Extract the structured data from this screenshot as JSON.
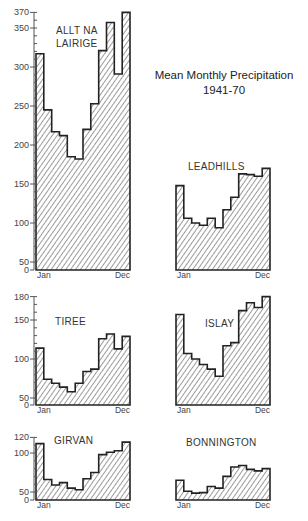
{
  "chart_data": {
    "type": "bar",
    "title": "Mean Monthly Precipitation",
    "subtitle": "1941-70",
    "xlabel_start": "Jan",
    "xlabel_end": "Dec",
    "categories": [
      "Jan",
      "Feb",
      "Mar",
      "Apr",
      "May",
      "Jun",
      "Jul",
      "Aug",
      "Sep",
      "Oct",
      "Nov",
      "Dec"
    ],
    "panels": [
      {
        "name": "ALLT NA LAIRIGE",
        "row": 0,
        "col": 0,
        "ylim": [
          0,
          370
        ],
        "yticks": [
          0,
          50,
          100,
          150,
          200,
          250,
          300,
          350,
          370
        ],
        "values": [
          317,
          245,
          217,
          212,
          185,
          182,
          220,
          253,
          321,
          357,
          291,
          370
        ]
      },
      {
        "name": "LEADHILLS",
        "row": 0,
        "col": 1,
        "ylim": [
          0,
          370
        ],
        "yticks": [],
        "values": [
          148,
          106,
          100,
          97,
          106,
          94,
          117,
          133,
          163,
          162,
          160,
          170
        ]
      },
      {
        "name": "TIREE",
        "row": 1,
        "col": 0,
        "ylim": [
          0,
          180
        ],
        "yticks": [
          0,
          50,
          100,
          150,
          180
        ],
        "values": [
          114,
          74,
          69,
          64,
          58,
          69,
          84,
          87,
          126,
          132,
          113,
          129
        ]
      },
      {
        "name": "ISLAY",
        "row": 1,
        "col": 1,
        "ylim": [
          0,
          180
        ],
        "yticks": [],
        "values": [
          157,
          107,
          100,
          93,
          87,
          78,
          117,
          121,
          162,
          172,
          166,
          180
        ]
      },
      {
        "name": "GIRVAN",
        "row": 2,
        "col": 0,
        "ylim": [
          0,
          120
        ],
        "yticks": [
          0,
          50,
          100,
          120
        ],
        "values": [
          112,
          66,
          59,
          62,
          55,
          53,
          67,
          75,
          98,
          101,
          103,
          114
        ]
      },
      {
        "name": "BONNINGTON",
        "row": 2,
        "col": 1,
        "ylim": [
          0,
          120
        ],
        "yticks": [],
        "values": [
          65,
          51,
          43,
          46,
          57,
          55,
          70,
          82,
          84,
          79,
          77,
          80
        ]
      }
    ],
    "ylabel": "mm",
    "grid": false
  },
  "layout": {
    "rows": [
      {
        "zero_y": 270,
        "fifty_y": 262,
        "px_per_unit": 0.78
      },
      {
        "zero_y": 405,
        "fifty_y": 398,
        "px_per_unit": 0.78
      },
      {
        "zero_y": 500,
        "fifty_y": 492,
        "px_per_unit": 0.78
      }
    ],
    "cols": [
      {
        "x0": 36,
        "x1": 130
      },
      {
        "x0": 176,
        "x1": 270
      }
    ]
  }
}
